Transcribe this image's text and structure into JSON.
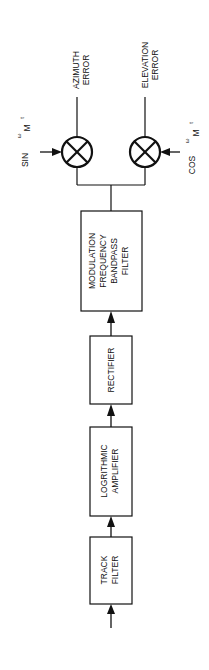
{
  "diagram": {
    "blocks": [
      {
        "id": "track-filter",
        "lines": [
          "TRACK",
          "FILTER"
        ]
      },
      {
        "id": "log-amp",
        "lines": [
          "LOGRITHMIC",
          "AMPLIFIER"
        ]
      },
      {
        "id": "rectifier",
        "lines": [
          "RECTIFIER"
        ]
      },
      {
        "id": "bandpass",
        "lines": [
          "MODULATION",
          "FREQUENCY",
          "BANDPASS",
          "FILTER"
        ]
      }
    ],
    "multipliers": [
      {
        "id": "azimuth-mixer",
        "ref_label": {
          "fn": "SIN",
          "omega": "ω",
          "sub": "M",
          "t": "t"
        },
        "output": [
          "AZIMUTH",
          "ERROR"
        ]
      },
      {
        "id": "elevation-mixer",
        "ref_label": {
          "fn": "COS",
          "omega": "ω",
          "sub": "M",
          "t": "t"
        },
        "output": [
          "ELEVATION",
          "ERROR"
        ]
      }
    ],
    "colors": {
      "line": "#111111",
      "background": "#ffffff"
    }
  }
}
